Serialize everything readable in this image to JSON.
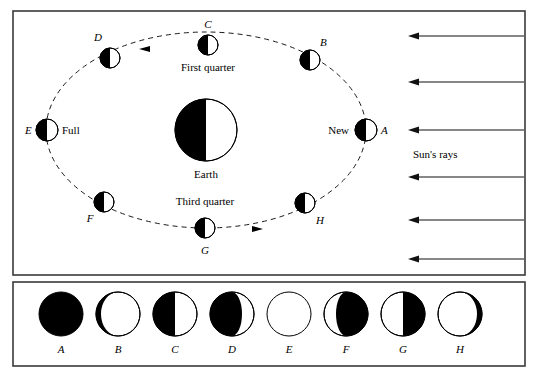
{
  "figure": {
    "bg_color": "#ffffff",
    "ink_color": "#000000",
    "border_color": "#3a3a3a"
  },
  "orbit_panel": {
    "name": "orbit-panel",
    "center_body": {
      "label": "Earth",
      "shading": "left-half-dark"
    },
    "sun": {
      "rays_label": "Sun's rays",
      "ray_count": 6,
      "direction": "right-to-left"
    },
    "orbit_direction_note": "counterclockwise",
    "phase_labels": [
      {
        "key": "first_quarter",
        "text": "First quarter"
      },
      {
        "key": "full",
        "text": "Full"
      },
      {
        "key": "third_quarter",
        "text": "Third quarter"
      },
      {
        "key": "new",
        "text": "New"
      }
    ],
    "moons": [
      {
        "id": "A",
        "label": "A",
        "cx": 366,
        "cy": 130,
        "r": 11,
        "shading": "left-half-dark",
        "phase_name": "New"
      },
      {
        "id": "B",
        "label": "B",
        "cx": 310,
        "cy": 60,
        "r": 10,
        "shading": "left-half-dark",
        "phase_name": ""
      },
      {
        "id": "C",
        "label": "C",
        "cx": 208,
        "cy": 45,
        "r": 10,
        "shading": "left-half-dark",
        "phase_name": "First quarter"
      },
      {
        "id": "D",
        "label": "D",
        "cx": 110,
        "cy": 58,
        "r": 10,
        "shading": "left-half-dark",
        "phase_name": ""
      },
      {
        "id": "E",
        "label": "E",
        "cx": 47,
        "cy": 130,
        "r": 11,
        "shading": "left-half-dark",
        "phase_name": "Full"
      },
      {
        "id": "F",
        "label": "F",
        "cx": 104,
        "cy": 202,
        "r": 10,
        "shading": "left-half-dark",
        "phase_name": ""
      },
      {
        "id": "G",
        "label": "G",
        "cx": 205,
        "cy": 228,
        "r": 10,
        "shading": "left-half-dark",
        "phase_name": "Third quarter"
      },
      {
        "id": "H",
        "label": "H",
        "cx": 305,
        "cy": 203,
        "r": 10,
        "shading": "left-half-dark",
        "phase_name": ""
      }
    ]
  },
  "phase_panel": {
    "name": "phase-key-panel",
    "items": [
      {
        "id": "A",
        "label": "A",
        "appearance": "fully-dark",
        "lit_fraction": 0.0,
        "lit_side": "none"
      },
      {
        "id": "B",
        "label": "B",
        "appearance": "thin-light-crescent-right",
        "lit_fraction": 0.12,
        "lit_side": "right"
      },
      {
        "id": "C",
        "label": "C",
        "appearance": "right-half-light",
        "lit_fraction": 0.5,
        "lit_side": "right"
      },
      {
        "id": "D",
        "label": "D",
        "appearance": "thin-dark-crescent-left",
        "lit_fraction": 0.88,
        "lit_side": "right"
      },
      {
        "id": "E",
        "label": "E",
        "appearance": "fully-light",
        "lit_fraction": 1.0,
        "lit_side": "all"
      },
      {
        "id": "F",
        "label": "F",
        "appearance": "thin-dark-crescent-right",
        "lit_fraction": 0.88,
        "lit_side": "left"
      },
      {
        "id": "G",
        "label": "G",
        "appearance": "left-half-light",
        "lit_fraction": 0.5,
        "lit_side": "left"
      },
      {
        "id": "H",
        "label": "H",
        "appearance": "thin-light-crescent-left",
        "lit_fraction": 0.12,
        "lit_side": "left"
      }
    ]
  }
}
